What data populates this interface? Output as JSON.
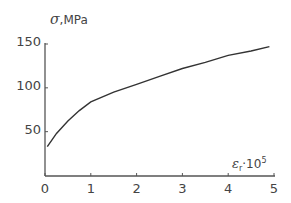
{
  "chart_data": {
    "type": "line",
    "title": "",
    "ylabel": "σ,MPa",
    "xlabel": "ε_r·10^5",
    "ylabel_parts": {
      "symbol": "σ",
      "unit": ",MPa"
    },
    "xlabel_parts": {
      "symbol": "ε",
      "sub": "r",
      "mid": "·10",
      "sup": "5"
    },
    "xlim": [
      0,
      5
    ],
    "ylim": [
      0,
      150
    ],
    "x_ticks": [
      "0",
      "1",
      "2",
      "3",
      "4",
      "5"
    ],
    "y_ticks": [
      "50",
      "100",
      "150"
    ],
    "grid": false,
    "legend": null,
    "series": [
      {
        "name": "σ vs ε_r",
        "x": [
          0.05,
          0.25,
          0.5,
          0.75,
          1.0,
          1.5,
          2.0,
          2.5,
          3.0,
          3.5,
          4.0,
          4.5,
          4.9
        ],
        "y": [
          33,
          48,
          62,
          74,
          84,
          95,
          104,
          113,
          122,
          129,
          137,
          142,
          147
        ]
      }
    ]
  }
}
